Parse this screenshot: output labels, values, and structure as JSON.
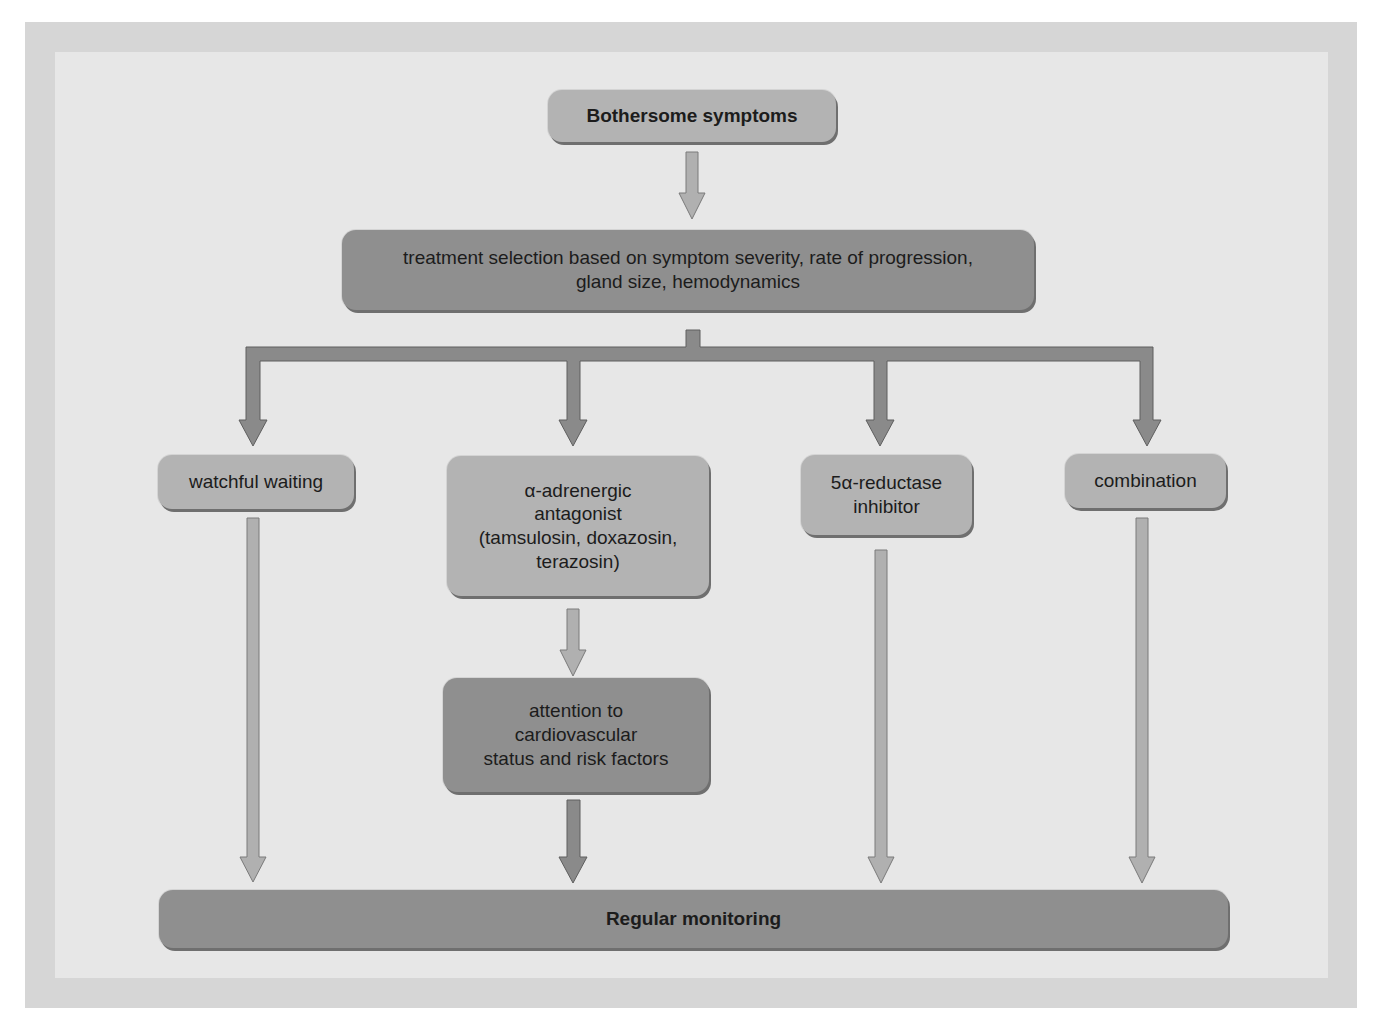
{
  "diagram": {
    "type": "flowchart",
    "nodes": {
      "start": {
        "label": "Bothersome symptoms"
      },
      "selection": {
        "label": "treatment selection based on symptom severity, rate of progression,\ngland size, hemodynamics"
      },
      "watchful": {
        "label": "watchful waiting"
      },
      "alpha": {
        "label": "α-adrenergic\nantagonist\n(tamsulosin, doxazosin,\nterazosin)"
      },
      "reductase": {
        "label": "5α-reductase\ninhibitor"
      },
      "combination": {
        "label": "combination"
      },
      "cardio": {
        "label": "attention to\ncardiovascular\nstatus and risk factors"
      },
      "monitoring": {
        "label": "Regular monitoring"
      }
    },
    "edges": [
      {
        "from": "start",
        "to": "selection"
      },
      {
        "from": "selection",
        "to": "watchful"
      },
      {
        "from": "selection",
        "to": "alpha"
      },
      {
        "from": "selection",
        "to": "reductase"
      },
      {
        "from": "selection",
        "to": "combination"
      },
      {
        "from": "alpha",
        "to": "cardio"
      },
      {
        "from": "watchful",
        "to": "monitoring"
      },
      {
        "from": "cardio",
        "to": "monitoring"
      },
      {
        "from": "reductase",
        "to": "monitoring"
      },
      {
        "from": "combination",
        "to": "monitoring"
      }
    ],
    "colors": {
      "frame": "#d6d6d6",
      "panel": "#e7e7e7",
      "light_box": "#b3b3b3",
      "dark_box": "#8f8f8f",
      "light_arrow": "#b0b0b0",
      "dark_arrow": "#8a8a8a"
    }
  }
}
